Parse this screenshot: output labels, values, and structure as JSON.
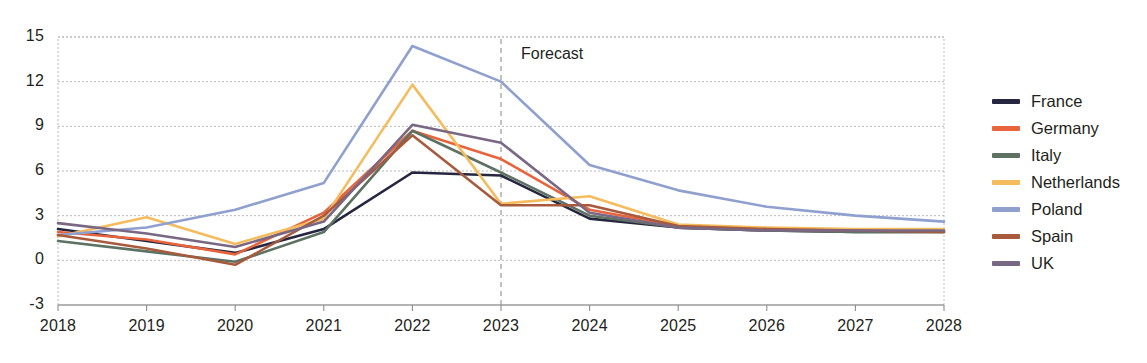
{
  "chart_data": {
    "type": "line",
    "title": "",
    "xlabel": "",
    "ylabel": "",
    "x": [
      2018,
      2019,
      2020,
      2021,
      2022,
      2023,
      2024,
      2025,
      2026,
      2027,
      2028
    ],
    "categories": [
      "2018",
      "2019",
      "2020",
      "2021",
      "2022",
      "2023",
      "2024",
      "2025",
      "2026",
      "2027",
      "2028"
    ],
    "xtick_labels": [
      "2018",
      "2019",
      "2020",
      "2021",
      "2022",
      "2023",
      "2024",
      "2025",
      "2026",
      "2027",
      "2028"
    ],
    "ytick_labels": [
      "15",
      "12",
      "9",
      "6",
      "3",
      "0",
      "-3"
    ],
    "yticks": [
      15,
      12,
      9,
      6,
      3,
      0,
      -3
    ],
    "ylim": [
      -3,
      15
    ],
    "xlim": [
      2018,
      2028
    ],
    "grid": "horizontal-dashed",
    "legend_position": "right",
    "annotations": [
      {
        "text": "Forecast",
        "x": 2023,
        "type": "vertical-dashed-line-label"
      }
    ],
    "series": [
      {
        "name": "France",
        "color": "#262640",
        "values": [
          2.1,
          1.3,
          0.5,
          2.1,
          5.9,
          5.7,
          2.8,
          2.2,
          2.0,
          1.9,
          1.9
        ]
      },
      {
        "name": "Germany",
        "color": "#e8643c",
        "values": [
          1.9,
          1.4,
          0.4,
          3.2,
          8.7,
          6.8,
          3.4,
          2.3,
          2.1,
          2.0,
          2.0
        ]
      },
      {
        "name": "Italy",
        "color": "#5e7263",
        "values": [
          1.3,
          0.6,
          -0.1,
          1.9,
          8.7,
          5.9,
          3.0,
          2.2,
          2.0,
          1.9,
          1.9
        ]
      },
      {
        "name": "Netherlands",
        "color": "#f5bc5e",
        "values": [
          1.6,
          2.9,
          1.1,
          2.8,
          11.8,
          3.8,
          4.3,
          2.4,
          2.2,
          2.1,
          2.1
        ]
      },
      {
        "name": "Poland",
        "color": "#8fa0cf",
        "values": [
          1.7,
          2.2,
          3.4,
          5.2,
          14.4,
          12.0,
          6.4,
          4.7,
          3.6,
          3.0,
          2.6
        ]
      },
      {
        "name": "Spain",
        "color": "#a85a3c",
        "values": [
          1.7,
          0.8,
          -0.3,
          3.0,
          8.4,
          3.7,
          3.7,
          2.3,
          2.1,
          2.0,
          1.9
        ]
      },
      {
        "name": "UK",
        "color": "#7a6784",
        "values": [
          2.5,
          1.8,
          0.9,
          2.6,
          9.1,
          7.9,
          3.2,
          2.2,
          2.0,
          2.0,
          2.0
        ]
      }
    ]
  },
  "legend": {
    "items": [
      {
        "label": "France",
        "color": "#262640"
      },
      {
        "label": "Germany",
        "color": "#e8643c"
      },
      {
        "label": "Italy",
        "color": "#5e7263"
      },
      {
        "label": "Netherlands",
        "color": "#f5bc5e"
      },
      {
        "label": "Poland",
        "color": "#8fa0cf"
      },
      {
        "label": "Spain",
        "color": "#a85a3c"
      },
      {
        "label": "UK",
        "color": "#7a6784"
      }
    ]
  },
  "annotation": {
    "forecast_label": "Forecast"
  },
  "axes": {
    "y_labels": [
      "15",
      "12",
      "9",
      "6",
      "3",
      "0",
      "-3"
    ],
    "x_labels": [
      "2018",
      "2019",
      "2020",
      "2021",
      "2022",
      "2023",
      "2024",
      "2025",
      "2026",
      "2027",
      "2028"
    ]
  },
  "colors": {
    "grid": "#b9b9b9",
    "axis": "#8c8c8c",
    "text": "#231f20",
    "background": "#ffffff"
  }
}
